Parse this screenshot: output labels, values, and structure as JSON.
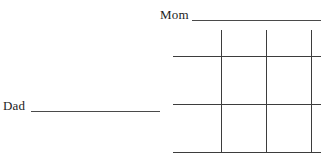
{
  "page": {
    "background_color": "#ffffff",
    "width": 324,
    "height": 158
  },
  "fields": [
    {
      "id": "mom",
      "label": "Mom",
      "value": "",
      "placeholder": "",
      "rule_color": "#4a4a4a",
      "orientation": "horizontal-top"
    },
    {
      "id": "dad",
      "label": "Dad",
      "value": "",
      "placeholder": "",
      "rule_color": "#4a4a4a",
      "orientation": "horizontal-left"
    }
  ],
  "grid": {
    "rows": 3,
    "columns": 3,
    "line_color": "#3d3d3d",
    "line_width": 1,
    "vertical_line_x": [
      221,
      266,
      311
    ],
    "horizontal_line_y": [
      56,
      104,
      152
    ],
    "cells": [
      {
        "row": 1,
        "column": 1,
        "value": ""
      },
      {
        "row": 1,
        "column": 2,
        "value": ""
      },
      {
        "row": 1,
        "column": 3,
        "value": ""
      },
      {
        "row": 2,
        "column": 1,
        "value": ""
      },
      {
        "row": 2,
        "column": 2,
        "value": ""
      },
      {
        "row": 2,
        "column": 3,
        "value": ""
      },
      {
        "row": 3,
        "column": 1,
        "value": ""
      },
      {
        "row": 3,
        "column": 2,
        "value": ""
      },
      {
        "row": 3,
        "column": 3,
        "value": ""
      }
    ]
  }
}
